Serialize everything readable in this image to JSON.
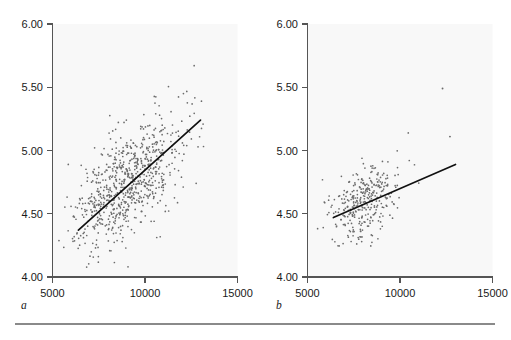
{
  "figure": {
    "background_color": "#ffffff",
    "plot_background_color": "#f8f8f8",
    "axis_color": "#555555",
    "point_color": "#6b6b6b",
    "line_color": "#111111",
    "rule_color": "#8a8a8a"
  },
  "panels": {
    "a": {
      "letter": "a",
      "y_ticks": [
        "6.00",
        "5.50",
        "5.00",
        "4.50",
        "4.00"
      ],
      "x_ticks": [
        "5000",
        "10000",
        "15000"
      ]
    },
    "b": {
      "letter": "b",
      "y_ticks": [
        "6.00",
        "5.50",
        "5.00",
        "4.50",
        "4.00"
      ],
      "x_ticks": [
        "5000",
        "10000",
        "15000"
      ]
    }
  },
  "chart_data": [
    {
      "type": "scatter",
      "panel": "a",
      "title": "",
      "xlabel": "",
      "ylabel": "",
      "xlim": [
        5000,
        15000
      ],
      "ylim": [
        4.0,
        6.0
      ],
      "xticks": [
        5000,
        10000,
        15000
      ],
      "yticks": [
        4.0,
        4.5,
        5.0,
        5.5,
        6.0
      ],
      "grid": false,
      "legend": "none",
      "n_points": 760,
      "trendline": {
        "x": [
          6400,
          13000
        ],
        "y": [
          4.37,
          5.24
        ],
        "slope": 0.000132,
        "intercept": 3.525
      },
      "point_cloud": {
        "x_mean": 9000,
        "x_sd": 1500,
        "y_mean": 4.73,
        "y_sd": 0.26,
        "correlation": 0.64
      },
      "x": [
        6500,
        6700,
        6900,
        7000,
        7100,
        7200,
        7250,
        7300,
        7350,
        7400,
        7450,
        7500,
        7550,
        7600,
        7650,
        7700,
        7750,
        7800,
        7850,
        7900,
        7950,
        8000,
        8050,
        8100,
        8150,
        8200,
        8250,
        8300,
        8350,
        8400,
        8450,
        8500,
        8550,
        8600,
        8650,
        8700,
        8750,
        8800,
        8850,
        8900,
        8950,
        9000,
        9050,
        9100,
        9150,
        9200,
        9250,
        9300,
        9350,
        9400,
        9450,
        9500,
        9550,
        9600,
        9650,
        9700,
        9750,
        9800,
        9850,
        9900,
        10000,
        10100,
        10200,
        10300,
        10400,
        10500,
        10600,
        10700,
        10800,
        10900,
        11000,
        11200,
        11400,
        11600,
        11800,
        12000,
        12200,
        12500,
        12800,
        13000
      ],
      "y": [
        4.42,
        4.46,
        4.4,
        4.52,
        4.38,
        4.55,
        4.6,
        4.44,
        4.63,
        4.5,
        4.7,
        4.48,
        4.58,
        4.66,
        4.42,
        4.74,
        4.54,
        4.62,
        4.46,
        4.8,
        4.56,
        4.68,
        4.5,
        4.76,
        4.6,
        4.84,
        4.52,
        4.72,
        4.64,
        4.88,
        4.58,
        4.78,
        4.66,
        4.92,
        4.7,
        4.82,
        4.6,
        4.96,
        4.74,
        4.86,
        4.68,
        5.0,
        4.76,
        4.9,
        4.72,
        5.04,
        4.8,
        4.94,
        4.78,
        5.08,
        4.84,
        4.98,
        4.82,
        5.12,
        4.88,
        5.02,
        4.86,
        5.16,
        4.92,
        5.06,
        4.96,
        5.1,
        5.0,
        5.18,
        5.04,
        5.14,
        5.08,
        5.22,
        5.12,
        5.16,
        5.06,
        5.2,
        5.1,
        5.24,
        5.14,
        5.18,
        5.08,
        5.22,
        5.16,
        5.26
      ]
    },
    {
      "type": "scatter",
      "panel": "b",
      "title": "",
      "xlabel": "",
      "ylabel": "",
      "xlim": [
        5000,
        15000
      ],
      "ylim": [
        4.0,
        6.0
      ],
      "xticks": [
        5000,
        10000,
        15000
      ],
      "yticks": [
        4.0,
        4.5,
        5.0,
        5.5,
        6.0
      ],
      "grid": false,
      "legend": "none",
      "n_points": 330,
      "trendline": {
        "x": [
          6400,
          13000
        ],
        "y": [
          4.47,
          4.89
        ],
        "slope": 6.36e-05,
        "intercept": 4.063
      },
      "point_cloud": {
        "x_mean": 8100,
        "x_sd": 900,
        "y_mean": 4.6,
        "y_sd": 0.16,
        "correlation": 0.38
      },
      "outliers": [
        {
          "x": 12300,
          "y": 5.49
        },
        {
          "x": 12700,
          "y": 5.11
        }
      ],
      "x": [
        6500,
        6700,
        6800,
        6900,
        7000,
        7050,
        7100,
        7150,
        7200,
        7250,
        7300,
        7350,
        7400,
        7450,
        7500,
        7550,
        7600,
        7650,
        7700,
        7750,
        7800,
        7850,
        7900,
        7950,
        8000,
        8050,
        8100,
        8150,
        8200,
        8250,
        8300,
        8350,
        8400,
        8450,
        8500,
        8550,
        8600,
        8650,
        8700,
        8750,
        8800,
        8850,
        8900,
        8950,
        9000,
        9100,
        9200,
        9300,
        9400,
        9500,
        9600,
        9800,
        12300,
        12700
      ],
      "y": [
        4.38,
        4.44,
        4.52,
        4.4,
        4.58,
        4.46,
        4.64,
        4.5,
        4.42,
        4.68,
        4.54,
        4.6,
        4.48,
        4.72,
        4.56,
        4.44,
        4.76,
        4.62,
        4.52,
        4.8,
        4.58,
        4.66,
        4.46,
        4.84,
        4.6,
        4.7,
        4.54,
        4.88,
        4.64,
        4.74,
        4.5,
        4.92,
        4.68,
        4.78,
        4.58,
        4.96,
        4.72,
        4.82,
        4.62,
        4.86,
        4.66,
        4.9,
        4.7,
        4.76,
        4.74,
        4.8,
        4.68,
        4.84,
        4.72,
        4.88,
        4.78,
        4.82,
        5.49,
        5.11
      ]
    }
  ]
}
